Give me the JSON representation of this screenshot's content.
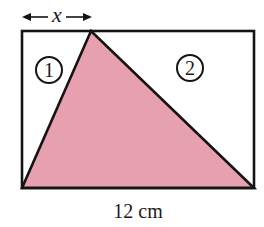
{
  "diagram": {
    "type": "geometry-figure",
    "colors": {
      "stroke": "#141414",
      "shaded_triangle": "#E6A0AF",
      "background": "#FFFFFF"
    },
    "rectangle": {
      "x": 22,
      "y": 31,
      "width": 232,
      "height": 157
    },
    "triangle": {
      "apex": [
        91,
        31
      ],
      "bottom_left": [
        22,
        188
      ],
      "bottom_right": [
        254,
        188
      ]
    },
    "regions": [
      {
        "id": "region-1",
        "label": "1",
        "cx": 49,
        "cy": 70,
        "r": 13
      },
      {
        "id": "region-2",
        "label": "2",
        "cx": 190,
        "cy": 68,
        "r": 13
      }
    ],
    "dimension_top": {
      "label": "x",
      "from_x": 22,
      "to_x": 92,
      "y": 17
    },
    "dimension_bottom": {
      "label": "12 cm"
    }
  }
}
